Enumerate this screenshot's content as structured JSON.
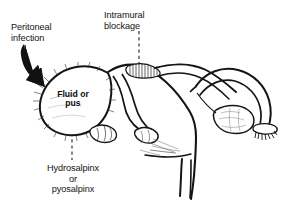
{
  "figure": {
    "title_alt": "Hydrosalpinx and pyosalpinx of the fallopian tube",
    "background_color": "#ffffff",
    "ink_color": "#111111"
  },
  "labels": {
    "peritoneal_infection": "Peritoneal\ninfection",
    "intramural_blockage": "Intramural\nblockage",
    "fluid_or_pus": "Fluid\nor\npus",
    "hydrosalpinx_or_pyosalpinx": "Hydrosalpinx\nor\npyosalpinx"
  },
  "annotations": {
    "peritoneal_arrow": "thick-curved-arrow-icon",
    "intramural_leader": "dashed-vertical-leader",
    "hydrosalpinx_leader": "dashed-vertical-leader"
  },
  "anatomy": [
    {
      "name": "dilated-left-fallopian-tube",
      "label": "hydrosalpinx sac"
    },
    {
      "name": "uterus-body",
      "label": "uterus"
    },
    {
      "name": "cervix",
      "label": "cervix"
    },
    {
      "name": "right-fallopian-tube",
      "label": "patent right tube"
    },
    {
      "name": "right-fimbriae",
      "label": "fimbriae"
    },
    {
      "name": "right-ovary",
      "label": "ovary"
    },
    {
      "name": "intramural-segment",
      "label": "blocked intramural segment"
    }
  ]
}
